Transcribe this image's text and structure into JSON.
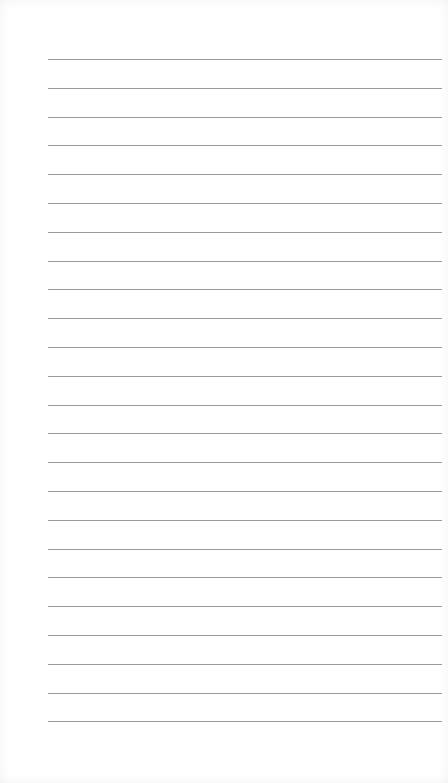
{
  "page": {
    "type": "lined-paper",
    "background_color": "#ffffff",
    "line_color": "#9a9a9a",
    "line_count": 24,
    "first_line_y": 59,
    "line_spacing": 28.8,
    "line_left": 48,
    "line_width": 394
  }
}
